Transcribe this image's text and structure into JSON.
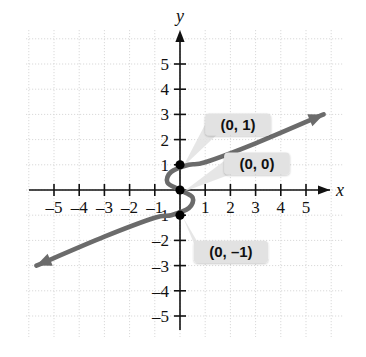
{
  "chart_data": {
    "type": "line",
    "title": "",
    "xlabel": "x",
    "ylabel": "y",
    "xlim": [
      -6.2,
      6.2
    ],
    "ylim": [
      -6.2,
      6.2
    ],
    "grid": true,
    "grid_style": "dotted",
    "grid_color": "#d9d9d9",
    "legend": "none",
    "axis_color": "#111111",
    "curve_color": "#6b6b6b",
    "point_color": "#000000",
    "callout_bg": "#e2e2e2",
    "x_ticks": [
      -5,
      -4,
      -3,
      -2,
      -1,
      1,
      2,
      3,
      4,
      5
    ],
    "y_ticks": [
      5,
      4,
      3,
      2,
      1,
      -1,
      -2,
      -3,
      -4,
      -5
    ],
    "x_tick_labels": [
      "–5",
      "–4",
      "–3",
      "–2",
      "–1",
      "1",
      "2",
      "3",
      "4",
      "5"
    ],
    "y_tick_labels": [
      "5",
      "4",
      "3",
      "2",
      "1",
      "–1",
      "–2",
      "–3",
      "–4",
      "–5"
    ],
    "series": [
      {
        "name": "sideways-cubic-relation",
        "description": "S-shaped curve (relation failing the vertical line test) passing through the three marked y-intercepts",
        "arrow_start": [
          -5.7,
          -3.0
        ],
        "arrow_end": [
          5.7,
          3.0
        ],
        "points": [
          [
            -5.7,
            -3.0
          ],
          [
            -3.0,
            -1.85
          ],
          [
            -1.0,
            -1.1
          ],
          [
            -0.35,
            -1.0
          ],
          [
            0.35,
            -0.72
          ],
          [
            0.5,
            -0.3
          ],
          [
            0.0,
            0.0
          ],
          [
            -0.5,
            0.3
          ],
          [
            -0.35,
            0.72
          ],
          [
            0.35,
            1.0
          ],
          [
            1.0,
            1.1
          ],
          [
            3.0,
            1.85
          ],
          [
            5.7,
            3.0
          ]
        ]
      }
    ],
    "marked_points": [
      {
        "label": "(0, 1)",
        "x": 0,
        "y": 1
      },
      {
        "label": "(0, 0)",
        "x": 0,
        "y": 0
      },
      {
        "label": "(0, –1)",
        "x": 0,
        "y": -1
      }
    ],
    "annotations": [
      {
        "id": "label-0-1",
        "text": "(0, 1)",
        "anchor_x": 0,
        "anchor_y": 1,
        "box_x": 1.0,
        "box_y": 2.6
      },
      {
        "id": "label-0-0",
        "text": "(0, 0)",
        "anchor_x": 0,
        "anchor_y": 0,
        "box_x": 1.75,
        "box_y": 1.05
      },
      {
        "id": "label-0-neg1",
        "text": "(0, –1)",
        "anchor_x": 0,
        "anchor_y": -1,
        "box_x": 0.55,
        "box_y": -2.45
      }
    ]
  }
}
